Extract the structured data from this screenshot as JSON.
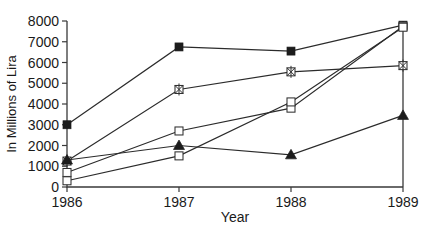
{
  "chart_data": {
    "type": "line",
    "title": "",
    "xlabel": "Year",
    "ylabel": "In Millions of Lira",
    "categories": [
      "1986",
      "1987",
      "1988",
      "1989"
    ],
    "x": [
      1986,
      1987,
      1988,
      1989
    ],
    "xlim": [
      1986,
      1989
    ],
    "ylim": [
      0,
      8000
    ],
    "yticks": [
      0,
      1000,
      2000,
      3000,
      4000,
      5000,
      6000,
      7000,
      8000
    ],
    "ytick_labels": [
      "0",
      "1000",
      "2000",
      "3000",
      "4000",
      "5000",
      "6000",
      "7000",
      "8000"
    ],
    "xticks": [
      1986,
      1987,
      1988,
      1989
    ],
    "xtick_labels": [
      "1986",
      "1987",
      "1988",
      "1989"
    ],
    "grid": false,
    "legend": "none",
    "series": [
      {
        "name": "Series 1",
        "marker": "filled-square",
        "values": [
          3000,
          6750,
          6550,
          7800
        ]
      },
      {
        "name": "Series 2",
        "marker": "crossed-square",
        "values": [
          1250,
          4700,
          5550,
          5850
        ]
      },
      {
        "name": "Series 3",
        "marker": "open-square",
        "values": [
          700,
          2700,
          3800,
          7750
        ]
      },
      {
        "name": "Series 4",
        "marker": "open-square",
        "values": [
          300,
          1500,
          4100,
          7700
        ]
      },
      {
        "name": "Series 5",
        "marker": "filled-triangle",
        "values": [
          1300,
          2000,
          1550,
          3450
        ]
      }
    ]
  },
  "axis": {
    "y_title": "In Millions of Lira",
    "x_title": "Year"
  }
}
